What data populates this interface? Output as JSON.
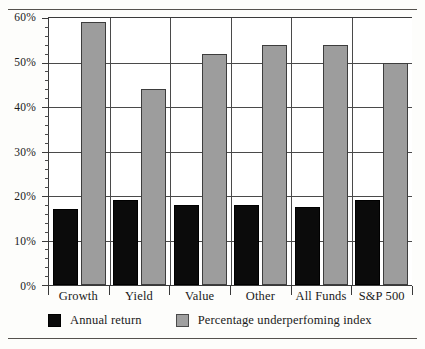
{
  "chart_data": {
    "type": "bar",
    "title": "",
    "xlabel": "",
    "ylabel": "",
    "ylim": [
      0,
      60
    ],
    "ytick_labels": [
      "0%",
      "10%",
      "20%",
      "30%",
      "40%",
      "50%",
      "60%"
    ],
    "ytick_values": [
      0,
      10,
      20,
      30,
      40,
      50,
      60
    ],
    "minor_tick_step": 2,
    "grid": "horizontal-major-and-vertical-group-separators",
    "legend_position": "bottom-left",
    "categories": [
      "Growth",
      "Yield",
      "Value",
      "Other",
      "All Funds",
      "S&P 500"
    ],
    "series": [
      {
        "name": "Annual return",
        "color": "#0b0b0b",
        "values": [
          17,
          19,
          18,
          18,
          17.5,
          19
        ]
      },
      {
        "name": "Percentage underperfoming index",
        "color": "#9d9d9d",
        "values": [
          59,
          44,
          52,
          54,
          54,
          50
        ]
      }
    ]
  },
  "axis": {
    "y_ticks": [
      {
        "label": "60%",
        "value": 60
      },
      {
        "label": "50%",
        "value": 50
      },
      {
        "label": "40%",
        "value": 40
      },
      {
        "label": "30%",
        "value": 30
      },
      {
        "label": "20%",
        "value": 20
      },
      {
        "label": "10%",
        "value": 10
      },
      {
        "label": "0%",
        "value": 0
      }
    ]
  },
  "legend": {
    "items": [
      {
        "label": "Annual return",
        "swatch": "black-square-swatch"
      },
      {
        "label": "Percentage underperfoming index",
        "swatch": "gray-square-swatch"
      }
    ]
  }
}
